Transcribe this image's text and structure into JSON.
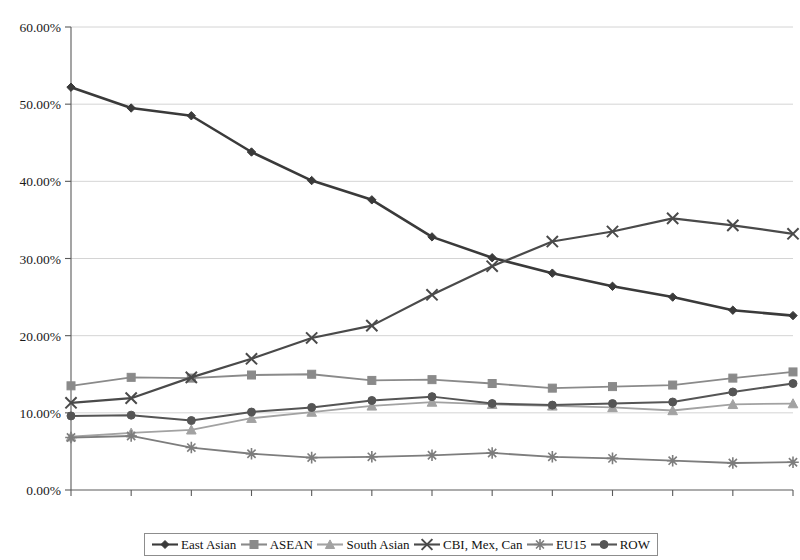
{
  "chart_data": {
    "type": "line",
    "title": "",
    "xlabel": "",
    "ylabel": "",
    "categories": [
      1989,
      1990,
      1991,
      1992,
      1993,
      1994,
      1995,
      1996,
      1997,
      1998,
      1999,
      2000,
      2001
    ],
    "x_tick_labels": [
      "1989",
      "1990",
      "1991",
      "1992",
      "1993",
      "1994",
      "1995",
      "1996",
      "1997",
      "1998",
      "1999",
      "2000",
      "2001"
    ],
    "y_tick_labels": [
      "0.00%",
      "10.00%",
      "20.00%",
      "30.00%",
      "40.00%",
      "50.00%",
      "60.00%"
    ],
    "y_ticks": [
      0,
      10,
      20,
      30,
      40,
      50,
      60
    ],
    "ylim": [
      0,
      60
    ],
    "y_unit": "%",
    "grid": "horizontal",
    "legend_position": "bottom",
    "series": [
      {
        "name": "East Asian",
        "marker": "diamond",
        "color": "#3a3a3a",
        "line_width": 2.6,
        "values": [
          52.2,
          49.5,
          48.5,
          43.8,
          40.1,
          37.6,
          32.8,
          30.1,
          28.1,
          26.4,
          25.0,
          23.3,
          22.6
        ]
      },
      {
        "name": "ASEAN",
        "marker": "square",
        "color": "#8a8a8a",
        "line_width": 1.8,
        "values": [
          13.5,
          14.6,
          14.5,
          14.9,
          15.0,
          14.2,
          14.3,
          13.8,
          13.2,
          13.4,
          13.6,
          14.5,
          15.3
        ]
      },
      {
        "name": "South Asian",
        "marker": "triangle",
        "color": "#a2a2a2",
        "line_width": 1.8,
        "values": [
          6.9,
          7.4,
          7.8,
          9.3,
          10.1,
          10.9,
          11.4,
          11.1,
          10.9,
          10.7,
          10.3,
          11.1,
          11.2
        ]
      },
      {
        "name": "CBI, Mex, Can",
        "marker": "x",
        "color": "#4a4a4a",
        "line_width": 2.2,
        "values": [
          11.3,
          11.9,
          14.6,
          17.0,
          19.7,
          21.3,
          25.3,
          29.0,
          32.2,
          33.5,
          35.2,
          34.3,
          33.2
        ]
      },
      {
        "name": "EU15",
        "marker": "asterisk",
        "color": "#7d7d7d",
        "line_width": 1.8,
        "values": [
          6.8,
          7.0,
          5.5,
          4.7,
          4.2,
          4.3,
          4.5,
          4.8,
          4.3,
          4.1,
          3.8,
          3.5,
          3.6
        ]
      },
      {
        "name": "ROW",
        "marker": "circle",
        "color": "#555555",
        "line_width": 2.0,
        "values": [
          9.6,
          9.7,
          9.0,
          10.1,
          10.7,
          11.6,
          12.1,
          11.2,
          11.0,
          11.2,
          11.4,
          12.7,
          13.8
        ]
      }
    ]
  },
  "legend": {
    "items": [
      {
        "label": "East Asian",
        "marker": "diamond",
        "color": "#3a3a3a"
      },
      {
        "label": "ASEAN",
        "marker": "square",
        "color": "#8a8a8a"
      },
      {
        "label": "South Asian",
        "marker": "triangle",
        "color": "#a2a2a2"
      },
      {
        "label": "CBI, Mex, Can",
        "marker": "x",
        "color": "#4a4a4a"
      },
      {
        "label": "EU15",
        "marker": "asterisk",
        "color": "#7d7d7d"
      },
      {
        "label": "ROW",
        "marker": "circle",
        "color": "#555555"
      }
    ]
  },
  "axes": {
    "axis_color": "#5a5a5a",
    "grid_color": "#c9c9c9",
    "tick_text_color": "#1a1a1a"
  }
}
